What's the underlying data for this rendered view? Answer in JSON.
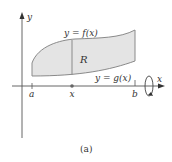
{
  "figure": {
    "caption": "(a)",
    "axes": {
      "x_label": "x",
      "y_label": "y"
    },
    "curves": {
      "top_label": "y = f(x)",
      "bottom_label": "y = g(x)"
    },
    "region_label": "R",
    "ticks": {
      "a": "a",
      "x": "x",
      "b": "b"
    },
    "colors": {
      "region_fill": "#e4e4e4",
      "curve_stroke": "#8a8a8a",
      "axis_stroke": "#555555",
      "text": "#333333"
    },
    "rotation_indicator": "rotation-about-x-axis"
  }
}
